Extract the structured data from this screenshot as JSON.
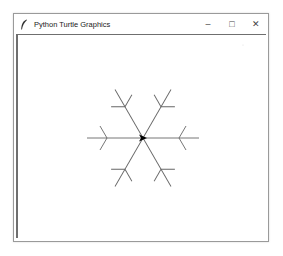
{
  "window": {
    "title": "Python Turtle Graphics",
    "app_icon": "feather-icon",
    "controls": {
      "minimize": "–",
      "maximize": "□",
      "close": "✕"
    }
  },
  "canvas": {
    "background": "#ffffff",
    "drawing": "snowflake",
    "stroke_color": "#555555",
    "turtle_color": "#000000",
    "turtle_shape": "classic-arrow",
    "turtle_heading_deg": 0
  }
}
